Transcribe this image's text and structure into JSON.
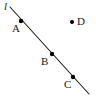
{
  "figure": {
    "kind": "geometry-diagram",
    "width": 96,
    "height": 106,
    "background_color": "#ffffff",
    "stroke_color": "#1a1a1a",
    "point_color": "#000000"
  },
  "line": {
    "label": "l",
    "x1": 10,
    "y1": 7,
    "x2": 89,
    "y2": 94,
    "stroke_width": 1.1
  },
  "points": [
    {
      "id": "A",
      "label": "A",
      "x": 21,
      "y": 21,
      "r": 2.2,
      "on_line": true,
      "label_x": 12,
      "label_y": 23
    },
    {
      "id": "B",
      "label": "B",
      "x": 52,
      "y": 54,
      "r": 2.2,
      "on_line": true,
      "label_x": 41,
      "label_y": 56
    },
    {
      "id": "C",
      "label": "C",
      "x": 73,
      "y": 77,
      "r": 2.2,
      "on_line": true,
      "label_x": 64,
      "label_y": 79
    },
    {
      "id": "D",
      "label": "D",
      "x": 72,
      "y": 22,
      "r": 2.0,
      "on_line": false,
      "label_x": 77,
      "label_y": 16
    }
  ],
  "line_label_position": {
    "x": 4,
    "y": 1
  }
}
